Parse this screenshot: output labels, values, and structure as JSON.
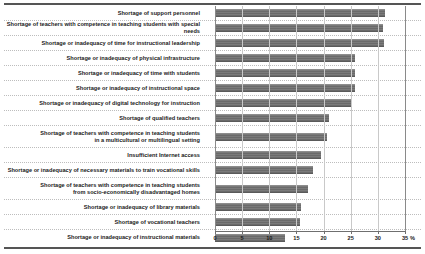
{
  "chart_data": {
    "type": "bar",
    "orientation": "horizontal",
    "title": "",
    "xlabel": "%",
    "ylabel": "",
    "xlim": [
      0,
      35
    ],
    "xticks": [
      0,
      5,
      10,
      15,
      20,
      25,
      30,
      35
    ],
    "xtick_labels": [
      "0",
      "5",
      "10",
      "15",
      "20",
      "25",
      "30",
      "35"
    ],
    "unit_label": "%",
    "grid": true,
    "legend": false,
    "bar_color": "#6e6e6e",
    "categories": [
      "Shortage of support personnel",
      "Shortage of teachers with competence in teaching students with special needs",
      "Shortage or inadequacy of time for instructional leadership",
      "Shortage or inadequacy of physical infrastructure",
      "Shortage or inadequacy of time with students",
      "Shortage or inadequacy of instructional space",
      "Shortage or inadequacy of digital technology for instruction",
      "Shortage of qualified teachers",
      "Shortage of teachers with competence in teaching students\nin a multicultural or multilingual setting",
      "Insufficient Internet access",
      "Shortage or inadequacy of necessary materials to train vocational skills",
      "Shortage of teachers with competence in teaching students\nfrom socio-economically disadvantaged homes",
      "Shortage or inadequacy of library materials",
      "Shortage of vocational teachers",
      "Shortage or inadequacy of instructional materials"
    ],
    "values": [
      31.3,
      31.0,
      31.2,
      25.8,
      25.8,
      25.8,
      25.0,
      21.0,
      20.6,
      19.5,
      18.0,
      17.1,
      15.8,
      15.7,
      12.9
    ],
    "two_line_rows": [
      8,
      11
    ]
  }
}
